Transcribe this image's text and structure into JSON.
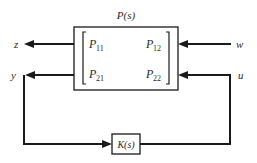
{
  "diagram": {
    "type": "block-diagram",
    "plant": {
      "label": "P(s)",
      "label_main": "P",
      "label_arg": "(s)",
      "matrix": [
        [
          {
            "main": "P",
            "sub": "11"
          },
          {
            "main": "P",
            "sub": "12"
          }
        ],
        [
          {
            "main": "P",
            "sub": "21"
          },
          {
            "main": "P",
            "sub": "22"
          }
        ]
      ]
    },
    "controller": {
      "label": "K(s)"
    },
    "signals": {
      "z": {
        "label": "z",
        "direction": "output",
        "from": "P(s)"
      },
      "y": {
        "label": "y",
        "direction": "output",
        "from": "P(s)",
        "to": "K(s)"
      },
      "w": {
        "label": "w",
        "direction": "input",
        "to": "P(s)"
      },
      "u": {
        "label": "u",
        "direction": "input",
        "to": "P(s)",
        "from": "K(s)"
      }
    },
    "colors": {
      "line": "#1a1a1a",
      "background": "#ffffff"
    }
  }
}
